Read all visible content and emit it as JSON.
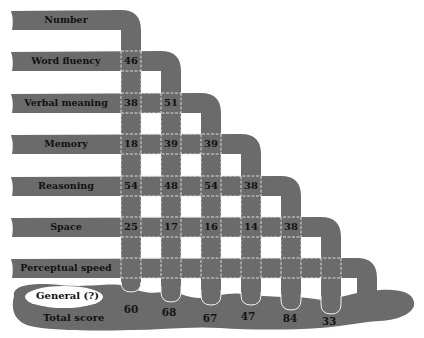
{
  "diagram": {
    "type": "factor-flow-diagram",
    "colors": {
      "band": "#6b6b6b",
      "background": "#ffffff",
      "divider": "#e8e8e8",
      "text": "#111111"
    },
    "rows": [
      {
        "label": "Number",
        "values": []
      },
      {
        "label": "Word fluency",
        "values": [
          "46"
        ]
      },
      {
        "label": "Verbal meaning",
        "values": [
          "38",
          "51"
        ]
      },
      {
        "label": "Memory",
        "values": [
          "18",
          "39",
          "39"
        ]
      },
      {
        "label": "Reasoning",
        "values": [
          "54",
          "48",
          "54",
          "38"
        ]
      },
      {
        "label": "Space",
        "values": [
          "25",
          "17",
          "16",
          "14",
          "38"
        ]
      },
      {
        "label": "Perceptual speed",
        "values": []
      }
    ],
    "pool": {
      "label": "General (?)",
      "sublabel": "Total score",
      "totals": [
        "60",
        "68",
        "67",
        "47",
        "84",
        "33"
      ]
    }
  }
}
